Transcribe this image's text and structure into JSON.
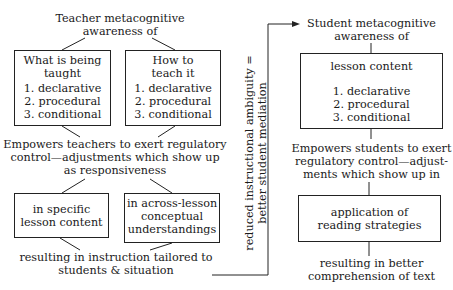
{
  "teacher": {
    "title_line1": "Teacher metacognitive",
    "title_line2": "awareness of",
    "box_what": {
      "line1": "What is being",
      "line2": "taught",
      "items": [
        "1. declarative",
        "2. procedural",
        "3. conditional"
      ]
    },
    "box_how": {
      "line1": "How to",
      "line2": "teach it",
      "items": [
        "1. declarative",
        "2. procedural",
        "3. conditional"
      ]
    },
    "empowers_line1": "Empowers teachers to exert regulatory",
    "empowers_line2": "control—adjustments which show up",
    "empowers_line3": "as responsiveness",
    "box_specific": {
      "line1": "in specific",
      "line2": "lesson content"
    },
    "box_across": {
      "line1": "in across-lesson",
      "line2": "conceptual",
      "line3": "understandings"
    },
    "result_line1": "resulting in instruction tailored to",
    "result_line2": "students & situation"
  },
  "connector": {
    "line1": "reduced instructional ambiguity =",
    "line2": "better student mediation"
  },
  "student": {
    "title_line1": "Student metacognitive",
    "title_line2": "awareness of",
    "box_lesson": {
      "heading": "lesson content",
      "items": [
        "1. declarative",
        "2. procedural",
        "3. conditional"
      ]
    },
    "empowers_line1": "Empowers students to exert",
    "empowers_line2": "regulatory control—adjust-",
    "empowers_line3": "ments which show up in",
    "box_application": {
      "line1": "application of",
      "line2": "reading strategies"
    },
    "result_line1": "resulting in better",
    "result_line2": "comprehension of text"
  }
}
